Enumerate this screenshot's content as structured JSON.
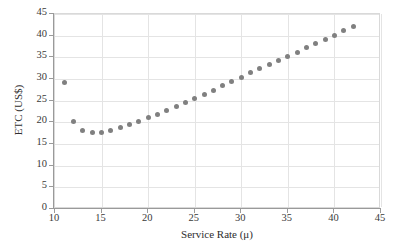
{
  "chart_data": {
    "type": "scatter",
    "title": "",
    "xlabel": "Service Rate (μ)",
    "ylabel": "ETC (US$)",
    "xlim": [
      10,
      45
    ],
    "ylim": [
      0,
      45
    ],
    "xticks": [
      10,
      15,
      20,
      25,
      30,
      35,
      40,
      45
    ],
    "yticks": [
      0,
      5,
      10,
      15,
      20,
      25,
      30,
      35,
      40,
      45
    ],
    "xtick_labels": [
      "10",
      "15",
      "20",
      "25",
      "30",
      "35",
      "40",
      "45"
    ],
    "ytick_labels": [
      "0",
      "5",
      "10",
      "15",
      "20",
      "25",
      "30",
      "35",
      "40",
      "45"
    ],
    "grid": true,
    "grid_axis": "both",
    "legend": false,
    "marker": "circle",
    "marker_color": "#808080",
    "marker_size": 5,
    "x": [
      11,
      12,
      13,
      14,
      15,
      16,
      17,
      18,
      19,
      20,
      21,
      22,
      23,
      24,
      25,
      26,
      27,
      28,
      29,
      30,
      31,
      32,
      33,
      34,
      35,
      36,
      37,
      38,
      39,
      40,
      41,
      42
    ],
    "y": [
      29.2,
      20.3,
      18.2,
      17.6,
      17.7,
      18.2,
      18.7,
      19.4,
      20.2,
      21.1,
      21.9,
      22.8,
      23.7,
      24.6,
      25.5,
      26.5,
      27.4,
      28.4,
      29.4,
      30.3,
      31.4,
      32.4,
      33.3,
      34.3,
      35.2,
      36.2,
      37.2,
      38.1,
      39.2,
      40.1,
      41.1,
      42.1
    ],
    "series": [
      {
        "name": "ETC",
        "x": [
          11,
          12,
          13,
          14,
          15,
          16,
          17,
          18,
          19,
          20,
          21,
          22,
          23,
          24,
          25,
          26,
          27,
          28,
          29,
          30,
          31,
          32,
          33,
          34,
          35,
          36,
          37,
          38,
          39,
          40,
          41,
          42
        ],
        "values": [
          29.2,
          20.3,
          18.2,
          17.6,
          17.7,
          18.2,
          18.7,
          19.4,
          20.2,
          21.1,
          21.9,
          22.8,
          23.7,
          24.6,
          25.5,
          26.5,
          27.4,
          28.4,
          29.4,
          30.3,
          31.4,
          32.4,
          33.3,
          34.3,
          35.2,
          36.2,
          37.2,
          38.1,
          39.2,
          40.1,
          41.1,
          42.1
        ]
      }
    ],
    "colors": {
      "marker": "#808080",
      "grid": "#e4e4e4",
      "axis": "#9a9a9a",
      "text": "#3a3a3a",
      "background": "#ffffff"
    }
  }
}
